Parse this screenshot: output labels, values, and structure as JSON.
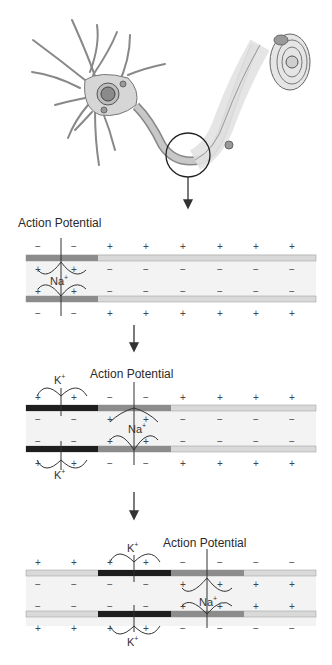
{
  "figure": {
    "top_illustration": "neuron-with-myelinated-axon, magnifier circle on axon"
  },
  "colors": {
    "membrane_rest": "#d9d9d9",
    "membrane_depolarized": "#8c8c8c",
    "membrane_repolarizing": "#1e1e1e",
    "axon_interior": "#f3f3f3",
    "neuron_fill": "#d6d6d6",
    "outline": "#555555"
  },
  "panels": [
    {
      "label": "Action Potential",
      "ion_inner": "Na",
      "ion_inner_sup": "+",
      "outer_top_signs": [
        "−",
        "−",
        "+",
        "+",
        "+",
        "+",
        "+",
        "+"
      ],
      "inner_top_signs": [
        "+",
        "+",
        "−",
        "−",
        "−",
        "−",
        "−",
        "−"
      ],
      "inner_bottom_signs": [
        "+",
        "+",
        "−",
        "−",
        "−",
        "−",
        "−",
        "−"
      ],
      "outer_bottom_signs": [
        "−",
        "−",
        "+",
        "+",
        "+",
        "+",
        "+",
        "+"
      ]
    },
    {
      "label": "Action Potential",
      "ion_inner": "Na",
      "ion_inner_sup": "+",
      "ion_outer": "K",
      "ion_outer_sup": "+",
      "outer_top_signs": [
        "+",
        "+",
        "−",
        "−",
        "+",
        "+",
        "+",
        "+"
      ],
      "inner_top_signs": [
        "−",
        "−",
        "+",
        "+",
        "−",
        "−",
        "−",
        "−"
      ],
      "inner_bottom_signs": [
        "−",
        "−",
        "+",
        "+",
        "−",
        "−",
        "−",
        "−"
      ],
      "outer_bottom_signs": [
        "+",
        "+",
        "−",
        "−",
        "+",
        "+",
        "+",
        "+"
      ]
    },
    {
      "label": "Action Potential",
      "ion_inner": "Na",
      "ion_inner_sup": "+",
      "ion_outer": "K",
      "ion_outer_sup": "+",
      "outer_top_signs": [
        "+",
        "+",
        "+",
        "+",
        "−",
        "−",
        "−",
        "−"
      ],
      "inner_top_signs": [
        "−",
        "−",
        "−",
        "−",
        "+",
        "+",
        "+",
        "+"
      ],
      "inner_bottom_signs": [
        "−",
        "−",
        "−",
        "−",
        "+",
        "+",
        "+",
        "+"
      ],
      "outer_bottom_signs": [
        "+",
        "+",
        "+",
        "+",
        "−",
        "−",
        "−",
        "−"
      ]
    }
  ]
}
